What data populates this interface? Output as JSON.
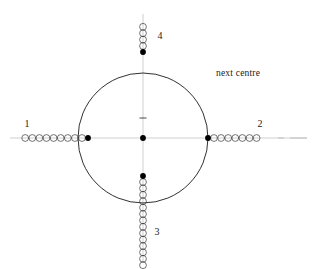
{
  "figure": {
    "background_color": "#ffffff",
    "width": 317,
    "height": 269,
    "stroke_color": "#1a1a1a",
    "axis_color": "#b0b0b0",
    "dot_color": "#000000",
    "circle": {
      "cx": 143,
      "cy": 138,
      "r": 65,
      "stroke_width": 0.9
    },
    "centre_tick": {
      "x": 143,
      "y": 118,
      "half_width": 3.5
    },
    "filled_dots": [
      {
        "name": "centre-dot",
        "x": 143,
        "y": 138,
        "r": 2.9
      },
      {
        "name": "top-dot",
        "x": 143,
        "y": 52,
        "r": 2.9
      },
      {
        "name": "bottom-dot",
        "x": 143,
        "y": 176,
        "r": 2.9
      },
      {
        "name": "left-dot",
        "x": 88,
        "y": 138,
        "r": 2.9
      },
      {
        "name": "right-dot",
        "x": 208,
        "y": 138,
        "r": 2.9
      }
    ],
    "axes": [
      {
        "name": "horizontal-axis",
        "x1": 10,
        "y1": 138,
        "x2": 307,
        "y2": 138
      },
      {
        "name": "vertical-axis",
        "x1": 143,
        "y1": 14,
        "x2": 143,
        "y2": 262
      }
    ],
    "dash_segments": [
      {
        "name": "right-axis-dash-1",
        "x1": 278,
        "y1": 138,
        "x2": 284,
        "y2": 138
      },
      {
        "name": "right-axis-dash-2",
        "x1": 290,
        "y1": 138,
        "x2": 307,
        "y2": 138
      }
    ],
    "arms": [
      {
        "name": "arm-1-left",
        "label": "1",
        "label_x": 27,
        "label_y": 119,
        "direction": "left",
        "circle_radius": 3.4,
        "circle_spacing": 7.1,
        "start_x": 82,
        "start_y": 138,
        "count": 9
      },
      {
        "name": "arm-2-right",
        "label": "2",
        "label_x": 260,
        "label_y": 119,
        "direction": "right",
        "circle_radius": 3.4,
        "circle_spacing": 7.1,
        "start_x": 214,
        "start_y": 138,
        "count": 7
      },
      {
        "name": "arm-3-bottom",
        "label": "3",
        "label_x": 157,
        "label_y": 227,
        "direction": "down",
        "circle_radius": 3.4,
        "circle_spacing": 6.4,
        "start_x": 143,
        "start_y": 182,
        "count": 14
      },
      {
        "name": "arm-4-top",
        "label": "4",
        "label_x": 160,
        "label_y": 31,
        "direction": "up",
        "circle_radius": 3.4,
        "circle_spacing": 6.4,
        "start_x": 143,
        "start_y": 46,
        "count": 4
      }
    ],
    "annotation": {
      "name": "next-centre-annotation",
      "text": "next centre",
      "x": 216,
      "y": 69
    }
  }
}
